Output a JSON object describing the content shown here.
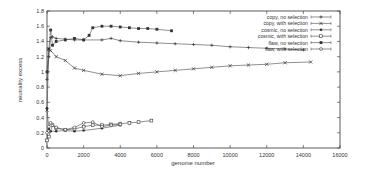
{
  "chart_data": {
    "type": "line",
    "title": "",
    "xlabel": "genome number",
    "ylabel": "neutrality excess",
    "xlim": [
      0,
      16000
    ],
    "ylim": [
      0,
      1.8
    ],
    "xticks": [
      0,
      2000,
      4000,
      6000,
      8000,
      10000,
      12000,
      14000,
      16000
    ],
    "yticks": [
      0,
      0.2,
      0.4,
      0.6,
      0.8,
      1,
      1.2,
      1.4,
      1.6,
      1.8
    ],
    "grid": false,
    "legend_position": "upper right",
    "series": [
      {
        "name": "copy, no selection",
        "marker": "plus",
        "x": [
          0,
          100,
          200,
          300,
          500,
          1000,
          1500,
          2000,
          3000,
          3500,
          4000,
          5000,
          6000,
          7000,
          8000,
          9000,
          10000,
          11000,
          12000,
          13000,
          14000
        ],
        "y": [
          0.9,
          1.2,
          1.45,
          1.46,
          1.44,
          1.43,
          1.42,
          1.42,
          1.42,
          1.44,
          1.41,
          1.39,
          1.38,
          1.37,
          1.36,
          1.35,
          1.33,
          1.32,
          1.31,
          1.3,
          1.29
        ]
      },
      {
        "name": "copy, with selection",
        "marker": "x",
        "x": [
          0,
          100,
          200,
          500,
          1000,
          1500,
          2000,
          3000,
          4000,
          5000,
          6000,
          7000,
          8000,
          9000,
          10000,
          11000,
          12000,
          13000,
          14400
        ],
        "y": [
          0.5,
          1.3,
          1.28,
          1.2,
          1.15,
          1.05,
          1.02,
          0.97,
          0.95,
          0.98,
          1.0,
          1.02,
          1.04,
          1.06,
          1.08,
          1.09,
          1.1,
          1.12,
          1.13
        ]
      },
      {
        "name": "cosmic, no selection",
        "marker": "filled-circle",
        "x": [
          0,
          100,
          200,
          500,
          1000,
          1500,
          2000,
          3000,
          4000
        ],
        "y": [
          0.52,
          0.25,
          0.22,
          0.22,
          0.23,
          0.22,
          0.23,
          0.26,
          0.3
        ]
      },
      {
        "name": "cosmic, with selection",
        "marker": "open-square",
        "x": [
          0,
          100,
          300,
          500,
          1000,
          1500,
          2000,
          2500,
          3000,
          3500,
          4000,
          4500,
          5000,
          5700
        ],
        "y": [
          0.1,
          0.15,
          0.3,
          0.26,
          0.24,
          0.25,
          0.28,
          0.3,
          0.3,
          0.31,
          0.32,
          0.33,
          0.34,
          0.36
        ]
      },
      {
        "name": "flaw, no selection",
        "marker": "filled-square",
        "x": [
          0,
          100,
          200,
          300,
          500,
          1000,
          1500,
          2000,
          2300,
          2500,
          3000,
          3500,
          4000,
          4500,
          5000,
          5500,
          6000,
          6800
        ],
        "y": [
          1.0,
          1.3,
          1.55,
          1.35,
          1.4,
          1.42,
          1.44,
          1.42,
          1.48,
          1.58,
          1.6,
          1.6,
          1.59,
          1.58,
          1.57,
          1.57,
          1.56,
          1.54
        ]
      },
      {
        "name": "flaw, with selection",
        "marker": "open-circle",
        "x": [
          0,
          100,
          200,
          500,
          1000,
          1500,
          2000,
          2500,
          3000,
          3500,
          4000
        ],
        "y": [
          0.2,
          0.28,
          0.33,
          0.27,
          0.24,
          0.27,
          0.33,
          0.34,
          0.28,
          0.3,
          0.31
        ]
      }
    ]
  }
}
